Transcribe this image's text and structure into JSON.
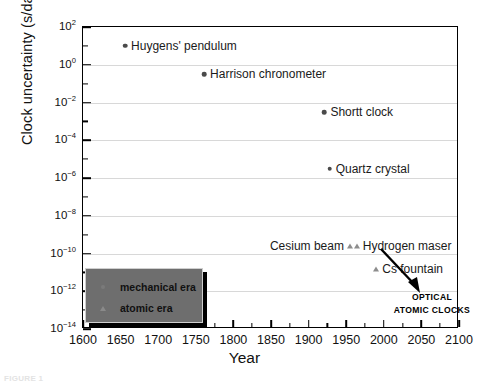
{
  "chart_data": {
    "type": "scatter",
    "title": "",
    "xlabel": "Year",
    "ylabel": "Clock uncertainty (s/day)",
    "xlim": [
      1600,
      2100
    ],
    "ylim_log10": [
      -14,
      2
    ],
    "yscale": "log",
    "grid": "horizontal",
    "xticks": [
      1600,
      1650,
      1700,
      1750,
      1800,
      1850,
      1900,
      1950,
      2000,
      2050,
      2100
    ],
    "xtick_labels": [
      "1600",
      "1650",
      "1700",
      "1750",
      "1800",
      "1850",
      "1900",
      "1950",
      "2000",
      "2050",
      "2100"
    ],
    "ytick_exponents": [
      2,
      0,
      -2,
      -4,
      -6,
      -8,
      -10,
      -12,
      -14
    ],
    "ytick_labels": [
      "10^2",
      "10^0",
      "10^-2",
      "10^-4",
      "10^-6",
      "10^-8",
      "10^-10",
      "10^-12",
      "10^-14"
    ],
    "series": [
      {
        "name": "mechanical era",
        "marker": "circle",
        "color": "#4a4a4a",
        "points": [
          {
            "label": "Huygens' pendulum",
            "year": 1656,
            "value_log10": 1.0,
            "value": "10",
            "label_side": "right"
          },
          {
            "label": "Harrison chronometer",
            "year": 1761,
            "value_log10": -0.5,
            "value": "0.3",
            "label_side": "right"
          },
          {
            "label": "Shortt clock",
            "year": 1921,
            "value_log10": -2.5,
            "value": "0.003",
            "label_side": "right"
          },
          {
            "label": "Quartz crystal",
            "year": 1928,
            "value_log10": -5.5,
            "value": "3e-6",
            "label_side": "right"
          }
        ]
      },
      {
        "name": "atomic era",
        "marker": "triangle",
        "color": "#8d8d8d",
        "points": [
          {
            "label": "Cesium beam",
            "year": 1955,
            "value_log10": -9.6,
            "value": "2.5e-10",
            "label_side": "left"
          },
          {
            "label": "Hydrogen maser",
            "year": 1964,
            "value_log10": -9.6,
            "value": "2.5e-10",
            "label_side": "right"
          },
          {
            "label": "Cs fountain",
            "year": 1990,
            "value_log10": -10.8,
            "value": "1.6e-11",
            "label_side": "right"
          }
        ]
      }
    ],
    "annotations": [
      {
        "name": "optical-atomic-clocks",
        "lines": [
          "OPTICAL",
          "ATOMIC CLOCKS"
        ],
        "arrow": true
      }
    ],
    "legend": {
      "position": "lower-left-inside",
      "entries": [
        {
          "marker": "circle",
          "label": "mechanical era"
        },
        {
          "marker": "triangle",
          "label": "atomic era"
        }
      ]
    }
  },
  "caption": "FIGURE 1",
  "colors": {
    "frame": "#000000",
    "grid": "#d8d8d8",
    "legend_fill": "#6e6e6e",
    "mechanical_marker": "#4a4a4a",
    "atomic_marker": "#8d8d8d",
    "text": "#1a1a1a"
  }
}
